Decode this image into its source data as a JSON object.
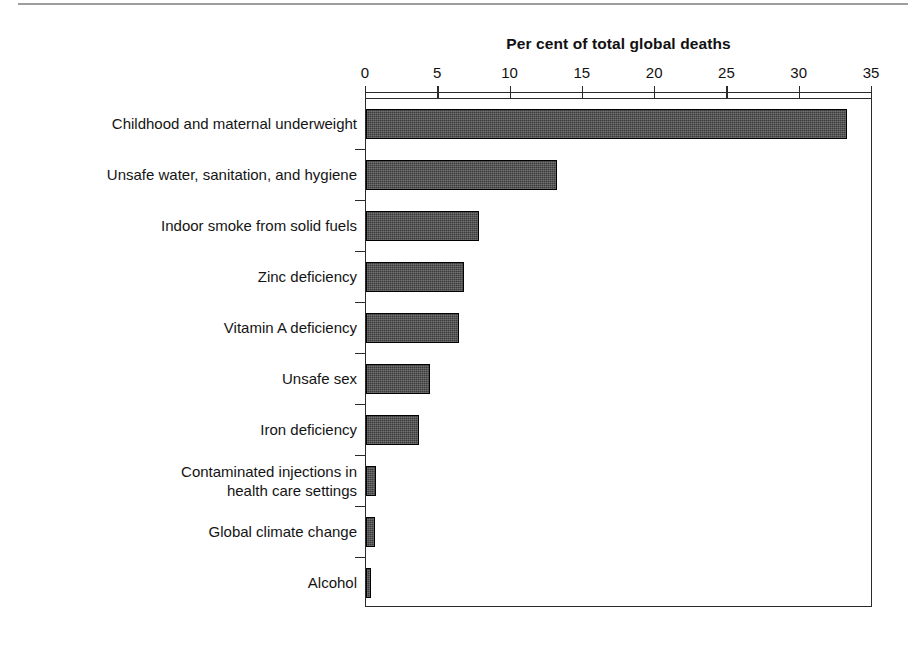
{
  "chart_data": {
    "type": "bar",
    "orientation": "horizontal",
    "title": "Per cent of total global deaths",
    "xlabel": "",
    "ylabel": "",
    "xlim": [
      0,
      35
    ],
    "xticks": [
      0,
      5,
      10,
      15,
      20,
      25,
      30,
      35
    ],
    "xtick_labels": [
      "0",
      "5",
      "10",
      "15",
      "20",
      "25",
      "30",
      "35"
    ],
    "grid": false,
    "legend": false,
    "axis_position": "top",
    "bar_color": "#4a4a4a",
    "bar_edge_color": "#000000",
    "categories": [
      "Childhood and maternal underweight",
      "Unsafe water, sanitation, and hygiene",
      "Indoor smoke from solid fuels",
      "Zinc deficiency",
      "Vitamin A deficiency",
      "Unsafe sex",
      "Iron deficiency",
      "Contaminated injections in\nhealth care settings",
      "Global climate change",
      "Alcohol"
    ],
    "values": [
      33.3,
      13.2,
      7.8,
      6.8,
      6.4,
      4.4,
      3.7,
      0.7,
      0.6,
      0.35
    ]
  }
}
